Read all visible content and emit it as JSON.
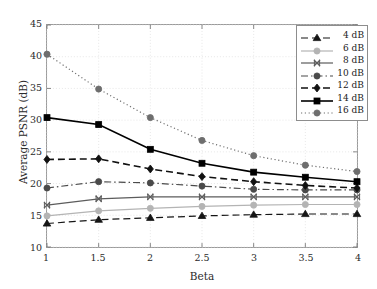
{
  "chart_data": {
    "type": "line",
    "title": "",
    "xlabel": "Beta",
    "ylabel": "Average PSNR (dB)",
    "xlim": [
      1,
      4
    ],
    "ylim": [
      10,
      45
    ],
    "xticks": [
      1,
      1.5,
      2,
      2.5,
      3,
      3.5,
      4
    ],
    "xtick_labels": [
      "1",
      "1.5",
      "2",
      "2.5",
      "3",
      "3.5",
      "4"
    ],
    "yticks": [
      10,
      15,
      20,
      25,
      30,
      35,
      40,
      45
    ],
    "ytick_labels": [
      "10",
      "15",
      "20",
      "25",
      "30",
      "35",
      "40",
      "45"
    ],
    "grid": true,
    "legend_position": "upper right",
    "x": [
      1,
      1.5,
      2,
      2.5,
      3,
      3.5,
      4
    ],
    "series": [
      {
        "name": "4 dB",
        "values": [
          13.7,
          14.3,
          14.6,
          14.9,
          15.1,
          15.2,
          15.2
        ],
        "color": "#151515",
        "marker": "triangle",
        "linestyle": "dashed"
      },
      {
        "name": "6 dB",
        "values": [
          14.9,
          15.7,
          16.1,
          16.4,
          16.6,
          16.7,
          16.7
        ],
        "color": "#b4b4b4",
        "marker": "circle",
        "linestyle": "solid"
      },
      {
        "name": "8 dB",
        "values": [
          16.6,
          17.6,
          17.9,
          17.9,
          17.9,
          17.9,
          17.9
        ],
        "color": "#5c5c5c",
        "marker": "x-cross",
        "linestyle": "solid"
      },
      {
        "name": "10 dB",
        "values": [
          19.3,
          20.3,
          20.1,
          19.6,
          19.1,
          19.0,
          19.0
        ],
        "color": "#4a4a4a",
        "marker": "circle",
        "linestyle": "dashdot"
      },
      {
        "name": "12 dB",
        "values": [
          23.8,
          23.9,
          22.3,
          21.1,
          20.3,
          19.7,
          19.3
        ],
        "color": "#111111",
        "marker": "diamond",
        "linestyle": "dashed"
      },
      {
        "name": "14 dB",
        "values": [
          30.4,
          29.3,
          25.4,
          23.2,
          21.8,
          21.0,
          20.3
        ],
        "color": "#000000",
        "marker": "square",
        "linestyle": "solid"
      },
      {
        "name": "16 dB",
        "values": [
          40.4,
          34.9,
          30.4,
          26.8,
          24.4,
          22.9,
          21.9
        ],
        "color": "#6e6e6e",
        "marker": "circle",
        "linestyle": "dotted"
      }
    ]
  },
  "axes": {
    "xlabel": "Beta",
    "ylabel": "Average PSNR (dB)"
  },
  "legend": {
    "items": [
      {
        "label": "4 dB"
      },
      {
        "label": "6 dB"
      },
      {
        "label": "8 dB"
      },
      {
        "label": "10 dB"
      },
      {
        "label": "12 dB"
      },
      {
        "label": "14 dB"
      },
      {
        "label": "16 dB"
      }
    ]
  }
}
